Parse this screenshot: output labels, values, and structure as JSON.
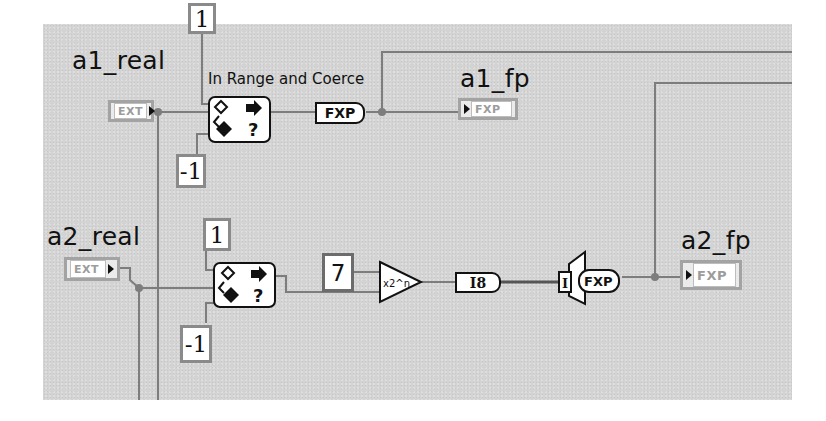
{
  "diagram": {
    "type": "LabVIEW block diagram",
    "canvas_color": "#d3d3d3",
    "wire_color": "#7d7d7d",
    "row1": {
      "input": {
        "label": "a1_real",
        "terminal_type": "EXT"
      },
      "upper_limit": "1",
      "lower_limit": "-1",
      "function_label": "In Range and Coerce",
      "conversion": "FXP",
      "output": {
        "label": "a1_fp",
        "terminal_type": "FXP"
      }
    },
    "row2": {
      "input": {
        "label": "a2_real",
        "terminal_type": "EXT"
      },
      "upper_limit": "1",
      "lower_limit": "-1",
      "scale_constant": "7",
      "scale_function": "x2^n",
      "conversion_int": "I8",
      "type_cast_in": "I",
      "type_cast_out": "FXP",
      "output": {
        "label": "a2_fp",
        "terminal_type": "FXP"
      }
    }
  },
  "icons": {
    "coerce": "in-range-and-coerce-icon",
    "scale": "scale-by-power-of-2-icon",
    "type_cast": "fixed-point-cast-icon"
  }
}
